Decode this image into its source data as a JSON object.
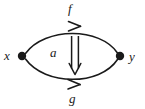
{
  "diagram": {
    "kind": "2-cell-diagram",
    "background_color": "#ffffff",
    "stroke_color": "#1a1a1a",
    "objects": [
      {
        "id": "x",
        "label": "x",
        "x": 22,
        "y": 56,
        "dot_radius": 4
      },
      {
        "id": "y",
        "label": "y",
        "x": 120,
        "y": 56,
        "dot_radius": 4
      }
    ],
    "arrows": [
      {
        "id": "f",
        "label": "f",
        "from": "x",
        "to": "y",
        "position": "top",
        "curve": "arc-up",
        "apex_y": 25,
        "arrowhead": "open-barb-right",
        "arrowhead_x": 78,
        "label_x": 72,
        "label_y": 9
      },
      {
        "id": "g",
        "label": "g",
        "from": "x",
        "to": "y",
        "position": "bottom",
        "curve": "arc-down",
        "apex_y": 88,
        "arrowhead": "open-barb-right",
        "arrowhead_x": 78,
        "label_x": 73,
        "label_y": 99
      }
    ],
    "two_cells": [
      {
        "id": "a",
        "label": "a",
        "from": "f",
        "to": "g",
        "glyph": "double-arrow-down",
        "direction": "down",
        "x": 75,
        "y_start": 36,
        "y_end": 74,
        "label_x": 55,
        "label_y": 53
      }
    ]
  }
}
